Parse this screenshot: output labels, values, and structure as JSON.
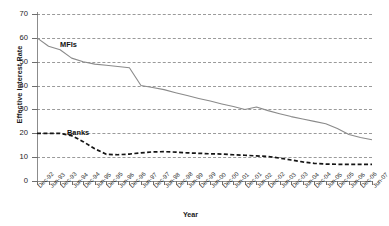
{
  "chart_data": {
    "type": "line",
    "title": "",
    "xlabel": "Year",
    "ylabel": "Effective Interest Rate",
    "ylim": [
      0,
      70
    ],
    "yticks": [
      0,
      10,
      20,
      30,
      40,
      50,
      60,
      70
    ],
    "grid": true,
    "legend_position": "inline-annotation",
    "categories": [
      "Dec-92",
      "Jun-93",
      "Dec-93",
      "Jun-94",
      "Dec-94",
      "Jun-95",
      "Dec-95",
      "Jun-96",
      "Dec-96",
      "Jun-97",
      "Dec-97",
      "Jun-98",
      "Dec-98",
      "Jun-99",
      "Dec-99",
      "Jun-00",
      "Dec-00",
      "Jun-01",
      "Dec-01",
      "Jun-02",
      "Dec-02",
      "Jun-03",
      "Dec-03",
      "Jun-04",
      "Dec-04",
      "Jun-05",
      "Dec-05",
      "Jun-06",
      "Dec-06",
      "Jun-07"
    ],
    "series": [
      {
        "name": "MFIs",
        "style": "solid",
        "color": "#8a8a8a",
        "values": [
          60.0,
          56.5,
          55.0,
          51.5,
          50.0,
          49.0,
          48.5,
          48.0,
          47.5,
          40.0,
          39.2,
          38.3,
          37.0,
          35.8,
          34.6,
          33.5,
          32.3,
          31.2,
          30.0,
          31.0,
          29.5,
          28.2,
          27.0,
          26.0,
          25.0,
          24.0,
          22.0,
          19.5,
          18.2,
          17.3
        ]
      },
      {
        "name": "Banks",
        "style": "dashed",
        "color": "#141414",
        "values": [
          20.0,
          20.0,
          20.0,
          19.0,
          16.5,
          13.5,
          11.2,
          11.0,
          11.3,
          11.8,
          12.2,
          12.3,
          12.1,
          11.8,
          11.6,
          11.4,
          11.3,
          11.0,
          10.8,
          10.5,
          10.3,
          9.6,
          8.8,
          8.0,
          7.4,
          7.1,
          7.0,
          7.0,
          7.0,
          7.0
        ]
      }
    ]
  },
  "axes": {
    "y_title": "Effective Interest Rate",
    "x_title": "Year"
  },
  "annotations": {
    "mfis": "MFIs",
    "banks": "Banks"
  },
  "colors": {
    "mfis_line": "#8a8a8a",
    "banks_line": "#141414",
    "gridline": "#9a9a9a",
    "axis": "#8c8c8c",
    "background": "#ffffff"
  }
}
